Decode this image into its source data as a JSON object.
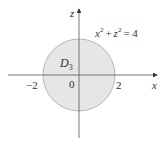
{
  "diagram": {
    "equation": {
      "base1": "x",
      "exp1": "2",
      "plus": "+",
      "base2": "z",
      "exp2": "2",
      "rhs": "= 4"
    },
    "region_label": "D",
    "region_subscript": "3",
    "axes": {
      "horizontal_label": "x",
      "vertical_label": "z",
      "origin_label": "0",
      "tick_neg": "−2",
      "tick_pos": "2"
    },
    "circle": {
      "radius": 2,
      "fill_color": "#e6e6e6",
      "stroke_color": "#a8a8a8"
    },
    "axis_color": "#555555"
  }
}
